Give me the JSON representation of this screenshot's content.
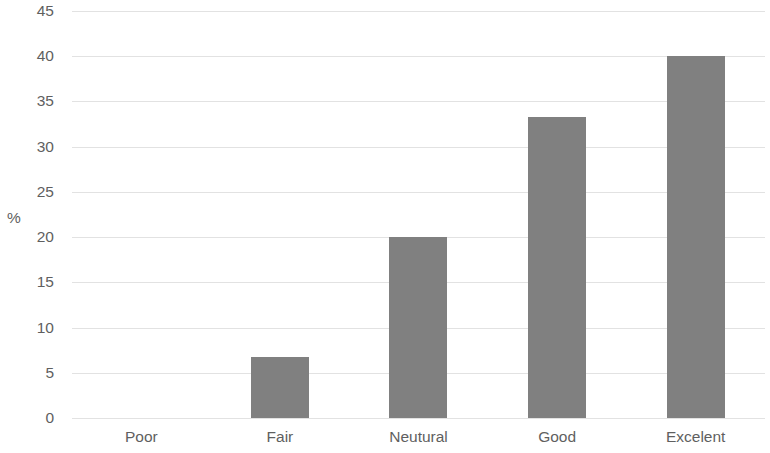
{
  "chart_data": {
    "type": "bar",
    "title": "",
    "subtitle": "",
    "xlabel": "",
    "ylabel": "%",
    "categories": [
      "Poor",
      "Fair",
      "Neutural",
      "Good",
      "Excelent"
    ],
    "values": [
      0,
      6.7,
      20,
      33.3,
      40
    ],
    "series": [
      {
        "name": "%",
        "values": [
          0,
          6.7,
          20,
          33.3,
          40
        ]
      }
    ],
    "ylim": [
      0,
      45
    ],
    "ytick_values": [
      0,
      5,
      10,
      15,
      20,
      25,
      30,
      35,
      40,
      45
    ],
    "ytick_labels": [
      "0",
      "5",
      "10",
      "15",
      "20",
      "25",
      "30",
      "35",
      "40",
      "45"
    ],
    "grid": true,
    "grid_axis": "y",
    "legend": false,
    "legend_position": "none",
    "bar_color": "#808080",
    "gridline_color": "#e2e2e2",
    "text_color": "#5f5f5f",
    "background_color": "#ffffff",
    "annotations": []
  }
}
